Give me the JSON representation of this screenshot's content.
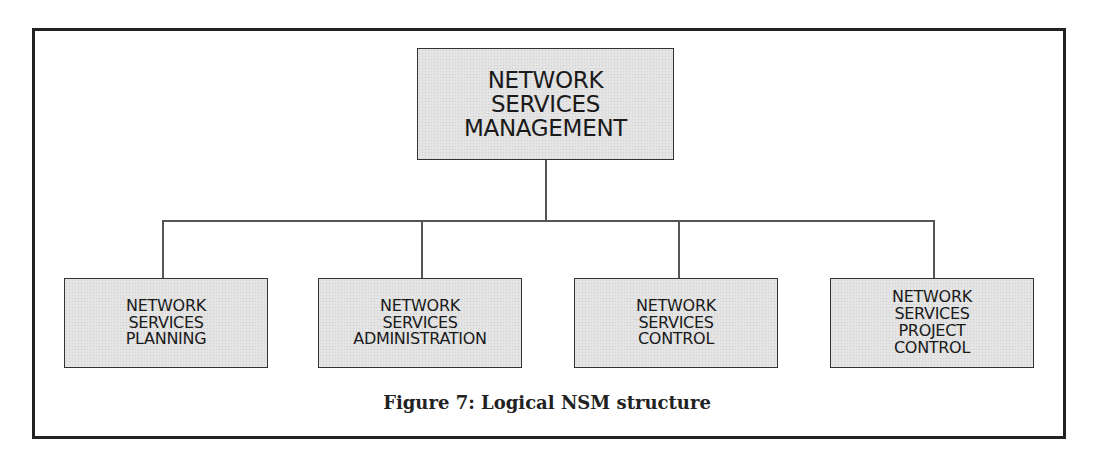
{
  "diagram": {
    "root": {
      "label": "NETWORK\nSERVICES\nMANAGEMENT"
    },
    "children": [
      {
        "label": "NETWORK\nSERVICES\nPLANNING"
      },
      {
        "label": "NETWORK\nSERVICES\nADMINISTRATION"
      },
      {
        "label": "NETWORK\nSERVICES\nCONTROL"
      },
      {
        "label": "NETWORK\nSERVICES\nPROJECT\nCONTROL"
      }
    ],
    "caption": "Figure 7: Logical NSM structure",
    "colors": {
      "box_fill": "#e4e4e4",
      "border": "#333333",
      "frame": "#222222"
    }
  }
}
